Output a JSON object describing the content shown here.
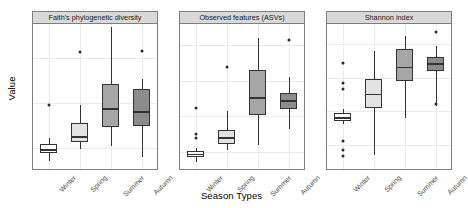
{
  "chart_data": {
    "type": "boxplot",
    "title": "",
    "xlabel": "Season Types",
    "ylabel": "Value",
    "categories": [
      "Winter",
      "Spring",
      "Summer",
      "Autumn"
    ],
    "legend": "none",
    "grid": true,
    "facets": [
      {
        "label": "Faith's phylogenetic diversity",
        "ylim": [
          5.5,
          37.5
        ],
        "yticks": [
          10,
          20,
          30
        ],
        "boxes": [
          {
            "category": "Winter",
            "min": 7.0,
            "q1": 8.8,
            "median": 9.5,
            "q3": 10.8,
            "max": 12.2,
            "outliers": [
              19.6
            ],
            "fill": "#ffffff"
          },
          {
            "category": "Spring",
            "min": 9.8,
            "q1": 11.2,
            "median": 12.4,
            "q3": 15.4,
            "max": 19.5,
            "outliers": [
              31.2
            ],
            "fill": "#e3e3e3"
          },
          {
            "category": "Summer",
            "min": 10.3,
            "q1": 14.6,
            "median": 18.6,
            "q3": 24.2,
            "max": 36.8,
            "outliers": [],
            "fill": "#a6a6a6"
          },
          {
            "category": "Autumn",
            "min": 8.0,
            "q1": 14.9,
            "median": 18.0,
            "q3": 23.0,
            "max": 25.2,
            "outliers": [
              31.4
            ],
            "fill": "#8c8c8c"
          }
        ]
      },
      {
        "label": "Observed features (ASVs)",
        "ylim": [
          55,
          460
        ],
        "yticks": [
          100,
          200,
          300,
          400
        ],
        "boxes": [
          {
            "category": "Winter",
            "min": 72,
            "q1": 85,
            "median": 93,
            "q3": 103,
            "max": 112,
            "outliers": [
              225,
              150,
              138
            ],
            "fill": "#ffffff"
          },
          {
            "category": "Spring",
            "min": 106,
            "q1": 122,
            "median": 140,
            "q3": 163,
            "max": 215,
            "outliers": [
              340
            ],
            "fill": "#e3e3e3"
          },
          {
            "category": "Summer",
            "min": 120,
            "q1": 205,
            "median": 252,
            "q3": 330,
            "max": 420,
            "outliers": [],
            "fill": "#a6a6a6"
          },
          {
            "category": "Autumn",
            "min": 165,
            "q1": 222,
            "median": 243,
            "q3": 265,
            "max": 310,
            "outliers": [
              415
            ],
            "fill": "#8c8c8c"
          }
        ]
      },
      {
        "label": "Shannon index",
        "ylim": [
          4.3,
          8.6
        ],
        "yticks": [
          5,
          6,
          7,
          8
        ],
        "boxes": [
          {
            "category": "Winter",
            "min": 5.6,
            "q1": 5.7,
            "median": 5.8,
            "q3": 5.95,
            "max": 6.05,
            "outliers": [
              7.45,
              6.85,
              6.65,
              5.1,
              4.85,
              4.65
            ],
            "fill": "#ffffff"
          },
          {
            "category": "Spring",
            "min": 4.7,
            "q1": 6.1,
            "median": 6.5,
            "q3": 6.95,
            "max": 7.8,
            "outliers": [],
            "fill": "#e3e3e3"
          },
          {
            "category": "Summer",
            "min": 5.8,
            "q1": 6.9,
            "median": 7.3,
            "q3": 7.85,
            "max": 8.25,
            "outliers": [],
            "fill": "#a6a6a6"
          },
          {
            "category": "Autumn",
            "min": 6.15,
            "q1": 7.2,
            "median": 7.4,
            "q3": 7.6,
            "max": 7.95,
            "outliers": [
              8.35,
              6.2
            ],
            "fill": "#8c8c8c"
          }
        ]
      }
    ]
  },
  "style": {
    "strip_bg": "#d9d9d9",
    "strip_border": "#7f7f7f",
    "panel_bg": "#ffffff",
    "grid_color": "#ebebeb",
    "axis_text": "#4d4d4d",
    "box_border": "#333333"
  }
}
